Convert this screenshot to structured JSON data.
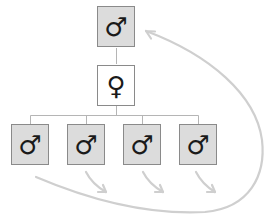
{
  "diagram": {
    "type": "family-tree",
    "colors": {
      "male_fill": "#dcdcdc",
      "female_fill": "#ffffff",
      "border": "#8a8a8a",
      "connector": "#b5b5b5",
      "arrow": "#cccccc"
    },
    "nodes": [
      {
        "id": "father",
        "sex": "male",
        "symbol": "♂"
      },
      {
        "id": "mother",
        "sex": "female",
        "symbol": "♀"
      },
      {
        "id": "son1",
        "sex": "male",
        "symbol": "♂"
      },
      {
        "id": "son2",
        "sex": "male",
        "symbol": "♂"
      },
      {
        "id": "son3",
        "sex": "male",
        "symbol": "♂"
      },
      {
        "id": "son4",
        "sex": "male",
        "symbol": "♂"
      }
    ],
    "arrows": [
      {
        "from": "son1",
        "to": "father",
        "style": "large-curve"
      },
      {
        "from": "son2",
        "style": "short-down-right"
      },
      {
        "from": "son3",
        "style": "short-down-right"
      },
      {
        "from": "son4",
        "style": "short-down-right"
      }
    ]
  }
}
